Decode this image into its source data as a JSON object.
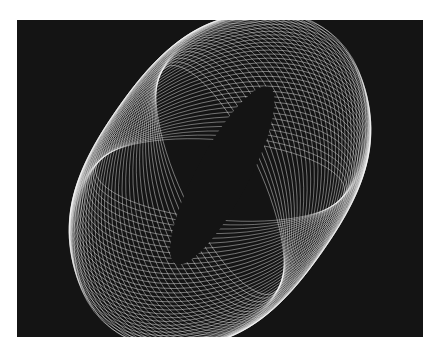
{
  "image": {
    "description": "White line-art spirograph-like pattern of many rotated ellipses on a black background",
    "background_color": "#141414",
    "line_color": "#ffffff",
    "page_background": "#ffffff"
  }
}
